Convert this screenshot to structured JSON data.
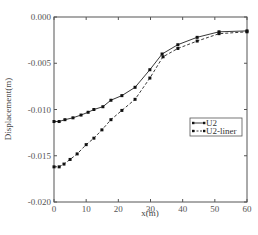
{
  "chart_data": {
    "type": "line",
    "title": "",
    "xlabel": "x(m)",
    "ylabel": "Displacement(m)",
    "xlim": [
      0,
      60
    ],
    "ylim": [
      -0.02,
      0.0
    ],
    "xticks": [
      0,
      10,
      20,
      30,
      40,
      50,
      60
    ],
    "xtick_labels": [
      "0",
      "10",
      "20",
      "30",
      "40",
      "50",
      "60"
    ],
    "yticks": [
      0.0,
      -0.005,
      -0.01,
      -0.015,
      -0.02
    ],
    "ytick_labels": [
      "0.000",
      "-0.005",
      "-0.010",
      "-0.015",
      "-0.020"
    ],
    "grid": false,
    "legend_position": "center-right",
    "series": [
      {
        "name": "U2",
        "style": "solid",
        "marker": "square",
        "x": [
          0,
          1.6,
          3.4,
          5.9,
          8.4,
          10.6,
          12.4,
          15.2,
          17.7,
          21.1,
          25.2,
          29.8,
          33.6,
          38.5,
          44.5,
          51.3,
          60
        ],
        "y": [
          -0.0113,
          -0.0113,
          -0.0111,
          -0.0109,
          -0.0106,
          -0.0103,
          -0.01,
          -0.0097,
          -0.009,
          -0.0085,
          -0.0076,
          -0.0057,
          -0.004,
          -0.003,
          -0.0022,
          -0.0016,
          -0.0015
        ]
      },
      {
        "name": "U2-liner",
        "style": "dashed",
        "marker": "square",
        "x": [
          0,
          1.6,
          3.1,
          5.0,
          7.2,
          10.0,
          12.4,
          14.9,
          17.7,
          21.1,
          25.2,
          29.8,
          33.9,
          38.5,
          44.5,
          51.3,
          60
        ],
        "y": [
          -0.0162,
          -0.0162,
          -0.0159,
          -0.0154,
          -0.0148,
          -0.0138,
          -0.0131,
          -0.0122,
          -0.0111,
          -0.0101,
          -0.0089,
          -0.0066,
          -0.0043,
          -0.0034,
          -0.0026,
          -0.0018,
          -0.0016
        ]
      }
    ]
  }
}
